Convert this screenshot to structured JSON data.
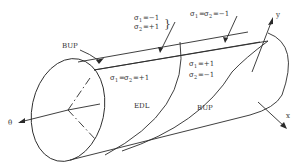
{
  "diagram": {
    "type": "cylinder-shell-region-diagram",
    "axes": {
      "theta": "θ",
      "y": "y",
      "x": "x"
    },
    "regions": {
      "edl": "EDL",
      "bup_lower": "BUP",
      "bup_upper": "BUP"
    },
    "annotations": {
      "top_left": {
        "line1_sym": "σ",
        "line1_sub": "1",
        "line1_val": "=−1",
        "line2_sym": "σ",
        "line2_sub": "2",
        "line2_val": "=+1"
      },
      "top_right": {
        "sym1": "σ",
        "sub1": "1",
        "eq": "=",
        "sym2": "σ",
        "sub2": "2",
        "val": "=−1"
      },
      "middle_left": {
        "sym1": "σ",
        "sub1": "1",
        "eq": "=",
        "sym2": "σ",
        "sub2": "2",
        "val": "=+1"
      },
      "middle_right": {
        "line1_sym": "σ",
        "line1_sub": "1",
        "line1_val": "=+1",
        "line2_sym": "σ",
        "line2_sub": "2",
        "line2_val": "=−1"
      }
    },
    "colors": {
      "line": "#2a2a2a",
      "text": "#333333",
      "background": "#ffffff"
    }
  }
}
